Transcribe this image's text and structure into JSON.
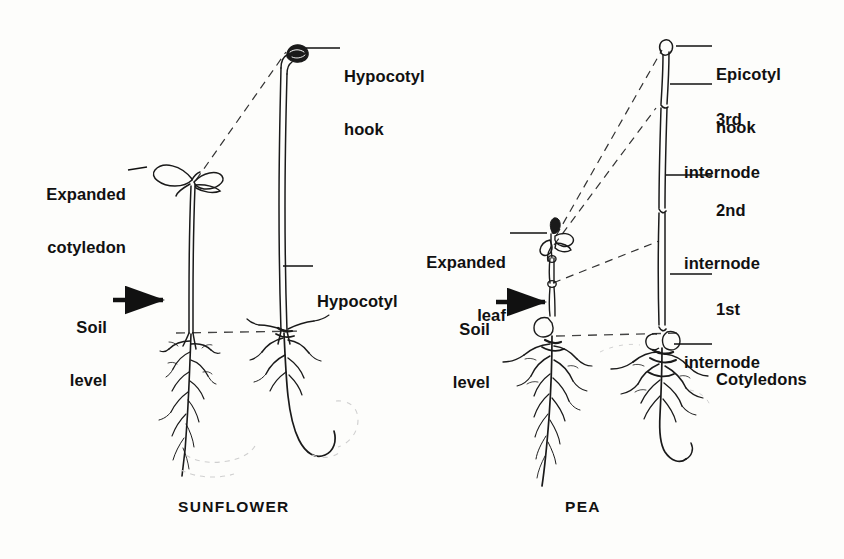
{
  "figure": {
    "type": "botanical-diagram",
    "background_color": "#fdfdfb",
    "ink_color": "#111111"
  },
  "panels": [
    {
      "id": "sunflower",
      "caption": "SUNFLOWER",
      "caption_x": 178,
      "caption_y": 498,
      "germination_type": "epigeal"
    },
    {
      "id": "pea",
      "caption": "PEA",
      "caption_x": 565,
      "caption_y": 498,
      "germination_type": "hypogeal"
    }
  ],
  "labels": [
    {
      "key": "hypocotyl_hook",
      "line1": "Hypocotyl",
      "line2": "hook",
      "align": "left",
      "x": 344,
      "y": 32,
      "leader": {
        "x1": 306,
        "y1": 48,
        "x2": 340,
        "y2": 48
      }
    },
    {
      "key": "expanded_cotyledon",
      "line1": "Expanded",
      "line2": "cotyledon",
      "align": "right",
      "x": 42,
      "y": 150,
      "leader": {
        "x1": 128,
        "y1": 170,
        "x2": 146,
        "y2": 168
      }
    },
    {
      "key": "hypocotyl",
      "line1": "Hypocotyl",
      "line2": "",
      "align": "left",
      "x": 317,
      "y": 257,
      "leader": {
        "x1": 283,
        "y1": 266,
        "x2": 313,
        "y2": 266
      }
    },
    {
      "key": "soil_level_sunflower",
      "line1": "Soil",
      "line2": "level",
      "align": "right",
      "x": 48,
      "y": 283,
      "arrow": {
        "x1": 113,
        "y1": 300,
        "x2": 168,
        "y2": 300
      }
    },
    {
      "key": "epicotyl_hook",
      "line1": "Epicotyl",
      "line2": "hook",
      "align": "left",
      "x": 716,
      "y": 30,
      "leader": {
        "x1": 676,
        "y1": 46,
        "x2": 712,
        "y2": 46
      }
    },
    {
      "key": "third_internode",
      "line1": "3rd",
      "line2": "internode",
      "align": "left",
      "x": 716,
      "y": 75,
      "leader": {
        "x1": 672,
        "y1": 84,
        "x2": 712,
        "y2": 84
      }
    },
    {
      "key": "second_internode",
      "line1": "2nd",
      "line2": "internode",
      "align": "left",
      "x": 716,
      "y": 166,
      "leader": {
        "x1": 668,
        "y1": 175,
        "x2": 712,
        "y2": 175
      }
    },
    {
      "key": "expanded_leaf",
      "line1": "Expanded",
      "line2": "leaf",
      "align": "right",
      "x": 420,
      "y": 218,
      "leader": {
        "x1": 510,
        "y1": 233,
        "x2": 545,
        "y2": 233
      }
    },
    {
      "key": "soil_level_pea",
      "line1": "Soil",
      "line2": "level",
      "align": "right",
      "x": 430,
      "y": 285,
      "arrow": {
        "x1": 496,
        "y1": 302,
        "x2": 548,
        "y2": 302
      }
    },
    {
      "key": "first_internode",
      "line1": "1st",
      "line2": "internode",
      "align": "left",
      "x": 716,
      "y": 265,
      "leader": {
        "x1": 672,
        "y1": 274,
        "x2": 712,
        "y2": 274
      }
    },
    {
      "key": "cotyledons",
      "line1": "Cotyledons",
      "line2": "",
      "align": "left",
      "x": 716,
      "y": 335,
      "leader": {
        "x1": 674,
        "y1": 344,
        "x2": 712,
        "y2": 344
      }
    }
  ],
  "soil_lines": [
    {
      "panel": "sunflower",
      "x1": 178,
      "y1": 333,
      "x2": 300,
      "y2": 331
    },
    {
      "panel": "pea",
      "x1": 556,
      "y1": 336,
      "x2": 680,
      "y2": 333
    }
  ],
  "connectors": [
    {
      "from": "sunflower-seedling-tip",
      "x1": 196,
      "y1": 180,
      "x2": 286,
      "y2": 52
    },
    {
      "from": "pea-seedling-apex",
      "x1": 556,
      "y1": 236,
      "x2": 662,
      "y2": 50
    },
    {
      "from": "pea-seedling-node",
      "x1": 554,
      "y1": 244,
      "x2": 656,
      "y2": 108
    },
    {
      "from": "pea-seedling-lower-node",
      "x1": 553,
      "y1": 283,
      "x2": 659,
      "y2": 241
    }
  ]
}
